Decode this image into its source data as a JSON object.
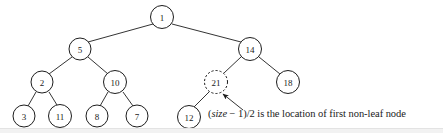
{
  "figure": {
    "background_color": "#ffffff",
    "stroke_color": "#1d1d1d",
    "nodes": [
      {
        "id": "n1",
        "label": "1",
        "cx": 162,
        "cy": 17,
        "r": 11.5,
        "style": "solid"
      },
      {
        "id": "n5",
        "label": "5",
        "cx": 80,
        "cy": 49,
        "r": 11.0,
        "style": "solid"
      },
      {
        "id": "n14",
        "label": "14",
        "cx": 250,
        "cy": 49,
        "r": 11.5,
        "style": "solid"
      },
      {
        "id": "n2",
        "label": "2",
        "cx": 42,
        "cy": 82,
        "r": 11.0,
        "style": "solid"
      },
      {
        "id": "n10",
        "label": "10",
        "cx": 115,
        "cy": 82,
        "r": 11.5,
        "style": "solid"
      },
      {
        "id": "n21",
        "label": "21",
        "cx": 216,
        "cy": 82,
        "r": 11.5,
        "style": "dashed"
      },
      {
        "id": "n18",
        "label": "18",
        "cx": 288,
        "cy": 82,
        "r": 11.5,
        "style": "solid"
      },
      {
        "id": "n3",
        "label": "3",
        "cx": 24,
        "cy": 116,
        "r": 11.0,
        "style": "solid"
      },
      {
        "id": "n11",
        "label": "11",
        "cx": 60,
        "cy": 116,
        "r": 11.5,
        "style": "solid"
      },
      {
        "id": "n8",
        "label": "8",
        "cx": 97,
        "cy": 116,
        "r": 11.0,
        "style": "solid"
      },
      {
        "id": "n7",
        "label": "7",
        "cx": 137,
        "cy": 116,
        "r": 11.0,
        "style": "solid"
      },
      {
        "id": "n12",
        "label": "12",
        "cx": 189,
        "cy": 117,
        "r": 11.5,
        "style": "solid"
      }
    ],
    "edges": [
      {
        "from": "n1",
        "to": "n5"
      },
      {
        "from": "n1",
        "to": "n14"
      },
      {
        "from": "n5",
        "to": "n2"
      },
      {
        "from": "n5",
        "to": "n10"
      },
      {
        "from": "n14",
        "to": "n21"
      },
      {
        "from": "n14",
        "to": "n18"
      },
      {
        "from": "n2",
        "to": "n3"
      },
      {
        "from": "n2",
        "to": "n11"
      },
      {
        "from": "n10",
        "to": "n8"
      },
      {
        "from": "n10",
        "to": "n7"
      },
      {
        "from": "n21",
        "to": "n12"
      }
    ],
    "annotation_arrow": {
      "name": "pointer-arrow-to-node-21",
      "from_x": 243,
      "from_y": 110,
      "to_x": 222,
      "to_y": 93
    },
    "caption": {
      "prefix": "(",
      "italic_term": "size",
      "suffix": " − 1)/2 is the location of first non-leaf node"
    }
  }
}
